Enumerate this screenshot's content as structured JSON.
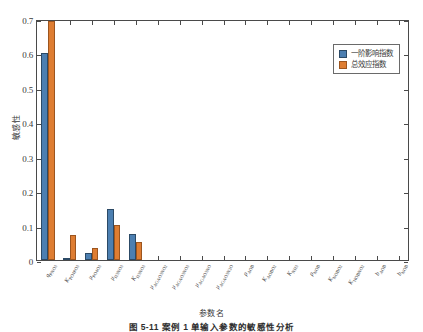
{
  "chart_data": {
    "type": "bar",
    "title": "",
    "xlabel": "参数名",
    "ylabel": "敏感性",
    "ylim": [
      0,
      0.7
    ],
    "yticks": [
      "0",
      "0.1",
      "0.2",
      "0.3",
      "0.4",
      "0.5",
      "0.6",
      "0.7"
    ],
    "ytick_values": [
      0,
      0.1,
      0.2,
      0.3,
      0.4,
      0.5,
      0.6,
      0.7
    ],
    "grid": false,
    "legend_position": "top-right",
    "categories": [
      "q_PNO3",
      "K_PO4PO3",
      "u_PO4O3",
      "u_H3NO3",
      "K_H3NO3",
      "u_AGAO3NO2",
      "u_AGAO3NO3",
      "u_AGAO3NO",
      "u_AGAO3N2O",
      "p_AO8",
      "K_AOBO2",
      "K_NH3",
      "p_NOB",
      "K_NOBO2",
      "K_NOBNO2",
      "b_AOB",
      "b_NOB"
    ],
    "categories_display": [
      {
        "base": "q",
        "sub": "PNO3",
        "italic": true
      },
      {
        "base": "K",
        "sub": "PO4PO3",
        "italic": true
      },
      {
        "base": "μ",
        "sub": "PO4O3",
        "italic": true
      },
      {
        "base": "μ",
        "sub": "H3NO3",
        "italic": true
      },
      {
        "base": "K",
        "sub": "H3NO3",
        "italic": true
      },
      {
        "base": "μ",
        "sub": "AGAO3NO2",
        "italic": true
      },
      {
        "base": "μ",
        "sub": "AGAO3NO3",
        "italic": true
      },
      {
        "base": "μ",
        "sub": "AGAO3NO",
        "italic": true
      },
      {
        "base": "μ",
        "sub": "AGAO3N2O",
        "italic": true
      },
      {
        "base": "ρ",
        "sub": "AOB",
        "italic": true
      },
      {
        "base": "K",
        "sub": "AOBO2",
        "italic": true
      },
      {
        "base": "K",
        "sub": "NH3",
        "italic": true
      },
      {
        "base": "ρ",
        "sub": "NOB",
        "italic": true
      },
      {
        "base": "K",
        "sub": "NOBO2",
        "italic": true
      },
      {
        "base": "K",
        "sub": "NOBNO2",
        "italic": true
      },
      {
        "base": "b",
        "sub": "AOB",
        "italic": true
      },
      {
        "base": "b",
        "sub": "NOB",
        "italic": true
      }
    ],
    "series": [
      {
        "name": "一阶影响指数",
        "color": "#4c7fb1",
        "values": [
          0.601,
          0.003,
          0.019,
          0.149,
          0.077,
          0,
          0,
          0,
          0,
          0,
          0,
          0,
          0,
          0,
          0,
          0,
          0
        ]
      },
      {
        "name": "总效应指数",
        "color": "#de7d32",
        "values": [
          0.695,
          0.073,
          0.034,
          0.103,
          0.051,
          0,
          0,
          0,
          0,
          0,
          0,
          0,
          0,
          0,
          0,
          0,
          0
        ]
      }
    ]
  },
  "legend": {
    "entries": [
      {
        "label": "一阶影响指数",
        "swatch": "first"
      },
      {
        "label": "总效应指数",
        "swatch": "total"
      }
    ]
  },
  "axes": {
    "y_title": "敏感性",
    "x_title": "参数名"
  },
  "caption": "图 5-11   案例 1 单输入参数的敏感性分析"
}
